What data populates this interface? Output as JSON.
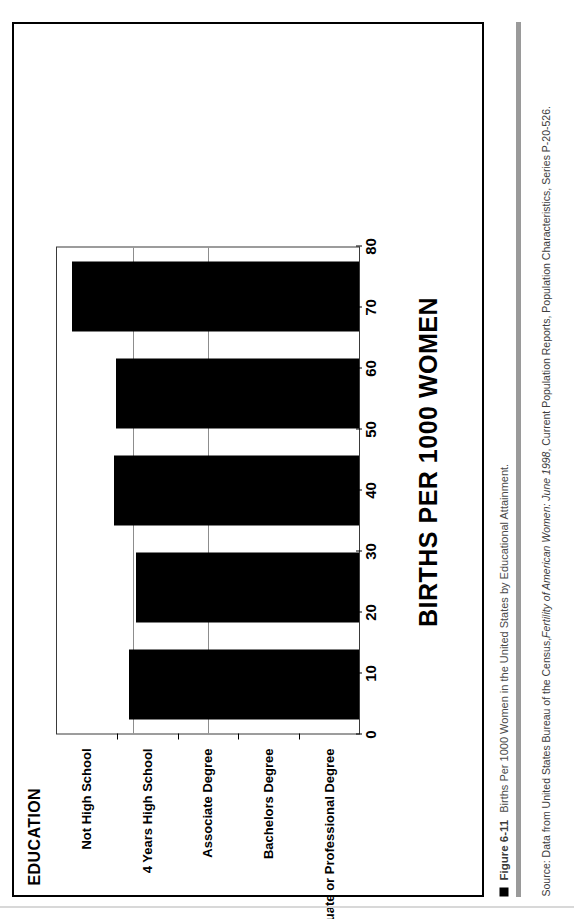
{
  "figure": {
    "number": "Figure 6-11",
    "caption": "Births Per 1000 Women in the United States by Educational Attainment.",
    "source": "Source: Data from United States Bureau of the Census, ",
    "source_italic": "Fertility of American Women: June 1998",
    "source_tail": ", Current Population Reports, Population Characteristics, Series P-20-526."
  },
  "chart_data": {
    "type": "bar",
    "orientation": "vertical-rotated-90",
    "title": "",
    "xlabel": "EDUCATION",
    "ylabel": "BIRTHS PER 1000 WOMEN",
    "categories": [
      "Not High School",
      "4 Years High School",
      "Associate Degree",
      "Bachelors Degree",
      "Graduate or Professional Degree"
    ],
    "values": [
      61,
      59,
      65,
      64.5,
      76
    ],
    "ylim": [
      0,
      80
    ],
    "yticks": [
      0,
      10,
      20,
      30,
      40,
      50,
      60,
      70,
      80
    ],
    "ytick_labels": [
      "0",
      "10",
      "20",
      "30",
      "40",
      "50",
      "60",
      "70",
      "80"
    ],
    "gridlines": [
      60,
      70
    ],
    "grid": true,
    "legend": "none",
    "bar_color": "#000000",
    "plot_background": "#FFFFFF"
  },
  "colors": {
    "ink": "#000000",
    "grid": "#8D8D8D",
    "caption_grey": "#3B3B3B",
    "rule_grey": "#9A9A9A"
  }
}
